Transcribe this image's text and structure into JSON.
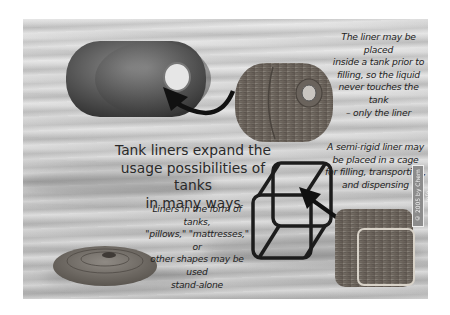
{
  "figure": {
    "title_lines": [
      "Tank liners expand the",
      "usage possibilities of tanks",
      "in many ways"
    ],
    "callouts": {
      "inside_tank": [
        "The liner may be placed",
        "inside a tank prior to",
        "filling, so the liquid",
        "never touches the tank",
        "– only the liner"
      ],
      "cage": [
        "A semi-rigid liner may",
        "be placed in a cage",
        "for filling, transporting,",
        "and dispensing"
      ],
      "standalone": [
        "Liners in the form of tanks,",
        "\"pillows,\" \"mattresses,\" or",
        "other shapes may be used",
        "stand-alone"
      ]
    },
    "copyright": "© 2005 by Chem Info",
    "illustrations": [
      "cylindrical-tank",
      "bottle-liner",
      "cage-frame",
      "cube-liner",
      "pillow-liner",
      "insert-arrow-1",
      "insert-arrow-2"
    ],
    "colors": {
      "background_gray": "#cfcfcf",
      "tank_gray": "#5a5a5a",
      "liner_brown_gray": "#7a7268",
      "arrow": "#111111"
    }
  }
}
